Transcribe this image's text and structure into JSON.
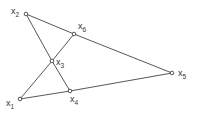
{
  "diagram": {
    "type": "graph",
    "stroke_color": "#444444",
    "node_fill": "#ffffff",
    "nodes": [
      {
        "id": "x1",
        "base": "x",
        "sub": "1",
        "x": 20,
        "y": 99,
        "label_dx": -14,
        "label_dy": 7
      },
      {
        "id": "x2",
        "base": "x",
        "sub": "2",
        "x": 26,
        "y": 14,
        "label_dx": -15,
        "label_dy": 0
      },
      {
        "id": "x3",
        "base": "x",
        "sub": "3",
        "x": 52,
        "y": 61,
        "label_dx": 4,
        "label_dy": 4
      },
      {
        "id": "x4",
        "base": "x",
        "sub": "4",
        "x": 70,
        "y": 91,
        "label_dx": 0,
        "label_dy": 11
      },
      {
        "id": "x5",
        "base": "x",
        "sub": "5",
        "x": 172,
        "y": 73,
        "label_dx": 6,
        "label_dy": 3
      },
      {
        "id": "x6",
        "base": "x",
        "sub": "6",
        "x": 74,
        "y": 34,
        "label_dx": 4,
        "label_dy": -5
      }
    ],
    "edges": [
      [
        "x2",
        "x6"
      ],
      [
        "x6",
        "x5"
      ],
      [
        "x2",
        "x3"
      ],
      [
        "x3",
        "x4"
      ],
      [
        "x1",
        "x3"
      ],
      [
        "x3",
        "x6"
      ],
      [
        "x1",
        "x4"
      ],
      [
        "x4",
        "x5"
      ]
    ]
  }
}
